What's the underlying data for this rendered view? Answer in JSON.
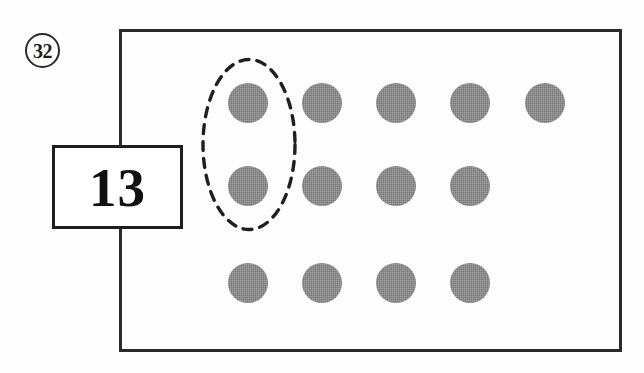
{
  "figure": {
    "number_label": "32",
    "count_label": "13"
  },
  "chart_data": {
    "type": "scatter",
    "title": "",
    "subtitle": "",
    "xlabel": "",
    "ylabel": "",
    "total_dots": 13,
    "dot_color": "#777777",
    "frame_color": "#2a2a2a",
    "outline_color": "#1e1e1e",
    "dot_diameter": 40,
    "rows": [
      {
        "row": 1,
        "count": 5,
        "y": 103,
        "x": [
          248,
          322,
          396,
          470,
          545
        ]
      },
      {
        "row": 2,
        "count": 4,
        "y": 186,
        "x": [
          248,
          322,
          396,
          470
        ]
      },
      {
        "row": 3,
        "count": 3,
        "y": 283,
        "x": [
          248,
          322,
          396,
          470
        ]
      }
    ],
    "points": [
      {
        "x": 248,
        "y": 103,
        "row": 1,
        "col": 1,
        "circled": true
      },
      {
        "x": 322,
        "y": 103,
        "row": 1,
        "col": 2,
        "circled": false
      },
      {
        "x": 396,
        "y": 103,
        "row": 1,
        "col": 3,
        "circled": false
      },
      {
        "x": 470,
        "y": 103,
        "row": 1,
        "col": 4,
        "circled": false
      },
      {
        "x": 545,
        "y": 103,
        "row": 1,
        "col": 5,
        "circled": false
      },
      {
        "x": 248,
        "y": 186,
        "row": 2,
        "col": 1,
        "circled": true
      },
      {
        "x": 322,
        "y": 186,
        "row": 2,
        "col": 2,
        "circled": false
      },
      {
        "x": 396,
        "y": 186,
        "row": 2,
        "col": 3,
        "circled": false
      },
      {
        "x": 470,
        "y": 186,
        "row": 2,
        "col": 4,
        "circled": false
      },
      {
        "x": 248,
        "y": 283,
        "row": 3,
        "col": 1,
        "circled": false
      },
      {
        "x": 322,
        "y": 283,
        "row": 3,
        "col": 2,
        "circled": false
      },
      {
        "x": 396,
        "y": 283,
        "row": 3,
        "col": 3,
        "circled": false
      },
      {
        "x": 470,
        "y": 283,
        "row": 3,
        "col": 4,
        "circled": false
      }
    ],
    "annotations": [
      {
        "kind": "dashed-ellipse",
        "encircles": "first column, rows 1 and 2",
        "cx": 249,
        "cy": 144,
        "rx": 48,
        "ry": 87
      },
      {
        "kind": "callout-box",
        "text": "13",
        "x": 52,
        "y": 145,
        "width": 131,
        "height": 84
      },
      {
        "kind": "circled-figure-number",
        "text": "32",
        "x": 25,
        "y": 33
      }
    ],
    "grid": false,
    "legend": null
  }
}
